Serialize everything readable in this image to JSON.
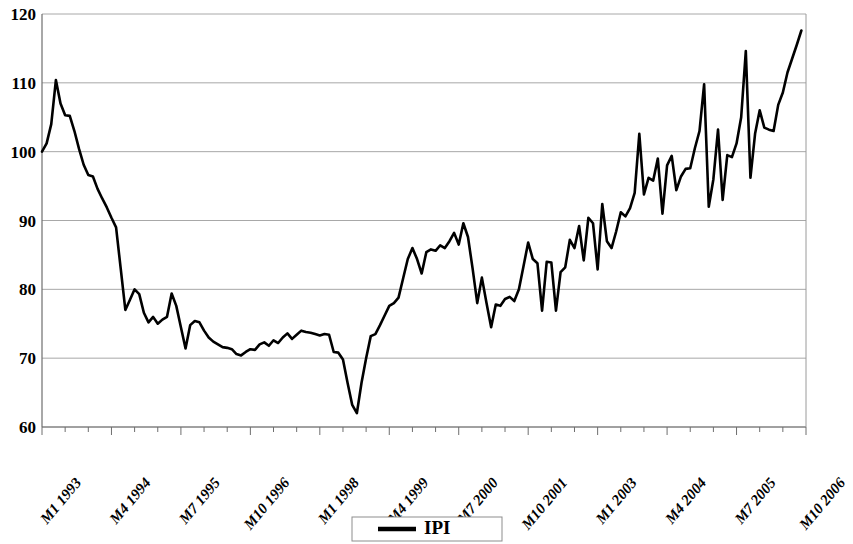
{
  "chart_data": {
    "type": "line",
    "title": "",
    "subtitle": "",
    "xlabel": "",
    "ylabel": "",
    "ylim": [
      60,
      120
    ],
    "ytick_values": [
      60,
      70,
      80,
      90,
      100,
      110,
      120
    ],
    "ytick_labels": [
      "60",
      "70",
      "80",
      "90",
      "100",
      "110",
      "120"
    ],
    "grid": true,
    "grid_axis": "y",
    "legend": {
      "position": "bottom-center",
      "entries": [
        {
          "name": "IPI",
          "color": "#000000",
          "marker": "line"
        }
      ]
    },
    "xtick_labels": [
      "M1 1993",
      "M4 1994",
      "M7 1995",
      "M10 1996",
      "M1 1998",
      "M4 1999",
      "M7 2000",
      "M10 2001",
      "M1 2003",
      "M4 2004",
      "M7 2005",
      "M10 2006"
    ],
    "xtick_interval_months": 15,
    "x_start_label": "M1 1993",
    "x_end_label": "M12 2006",
    "series": [
      {
        "name": "IPI",
        "color": "#000000",
        "values": [
          100.0,
          101.2,
          104.0,
          110.4,
          107.0,
          105.3,
          105.2,
          103.0,
          100.4,
          98.1,
          96.6,
          96.4,
          94.6,
          93.2,
          91.9,
          90.4,
          89.0,
          83.0,
          77.0,
          78.5,
          80.0,
          79.3,
          76.6,
          75.2,
          76.0,
          75.0,
          75.6,
          76.0,
          79.4,
          77.6,
          74.5,
          71.4,
          74.8,
          75.4,
          75.2,
          74.0,
          73.0,
          72.4,
          72.0,
          71.6,
          71.5,
          71.3,
          70.6,
          70.4,
          70.9,
          71.3,
          71.2,
          72.0,
          72.3,
          71.8,
          72.6,
          72.2,
          73.0,
          73.6,
          72.8,
          73.4,
          74.0,
          73.8,
          73.7,
          73.5,
          73.3,
          73.5,
          73.4,
          70.9,
          70.8,
          69.8,
          66.4,
          63.2,
          62.0,
          66.4,
          70.0,
          73.2,
          73.5,
          74.8,
          76.2,
          77.6,
          78.0,
          78.8,
          81.6,
          84.4,
          86.0,
          84.4,
          82.3,
          85.4,
          85.8,
          85.6,
          86.4,
          86.0,
          87.0,
          88.2,
          86.5,
          89.6,
          87.6,
          83.0,
          78.0,
          81.7,
          78.0,
          74.5,
          77.8,
          77.6,
          78.6,
          78.9,
          78.3,
          80.0,
          83.4,
          86.8,
          84.4,
          83.8,
          76.9,
          84.0,
          83.9,
          76.9,
          82.5,
          83.2,
          87.2,
          86.0,
          89.2,
          84.2,
          90.4,
          89.6,
          82.9,
          92.4,
          87.0,
          86.0,
          88.4,
          91.2,
          90.6,
          91.8,
          94.0,
          102.6,
          93.8,
          96.2,
          95.8,
          99.0,
          91.0,
          98.0,
          99.4,
          94.4,
          96.4,
          97.5,
          97.6,
          100.5,
          103.0,
          109.8,
          92.0,
          96.0,
          103.2,
          93.0,
          99.5,
          99.2,
          101.2,
          105.0,
          114.6,
          96.2,
          102.6,
          106.0,
          103.5,
          103.2,
          103.0,
          106.8,
          108.6,
          111.5,
          113.5,
          115.5,
          117.6
        ]
      }
    ]
  }
}
